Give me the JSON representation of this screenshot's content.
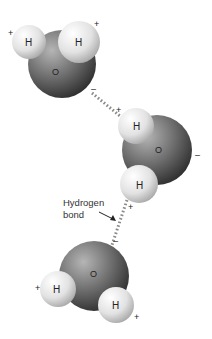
{
  "diagram": {
    "annotation": {
      "line1": "Hydrogen",
      "line2": "bond"
    },
    "molecules": [
      {
        "name": "water-molecule-top",
        "oxygen": {
          "label": "O",
          "charge": "–"
        },
        "hydrogens": [
          {
            "label": "H",
            "charge": "+"
          },
          {
            "label": "H",
            "charge": "+"
          }
        ]
      },
      {
        "name": "water-molecule-middle",
        "oxygen": {
          "label": "O",
          "charge": "–"
        },
        "hydrogens": [
          {
            "label": "H",
            "charge": "+"
          },
          {
            "label": "H",
            "charge": "+"
          }
        ]
      },
      {
        "name": "water-molecule-bottom",
        "oxygen": {
          "label": "O",
          "charge": "–"
        },
        "hydrogens": [
          {
            "label": "H",
            "charge": "+"
          },
          {
            "label": "H",
            "charge": "+"
          }
        ]
      }
    ],
    "colors": {
      "oxygen_light": "#9a9a9a",
      "oxygen_dark": "#3a3a3a",
      "hydrogen_light": "#f4f4f4",
      "hydrogen_dark": "#b8b8b8",
      "bond_dots": "#8a8a8a"
    }
  }
}
